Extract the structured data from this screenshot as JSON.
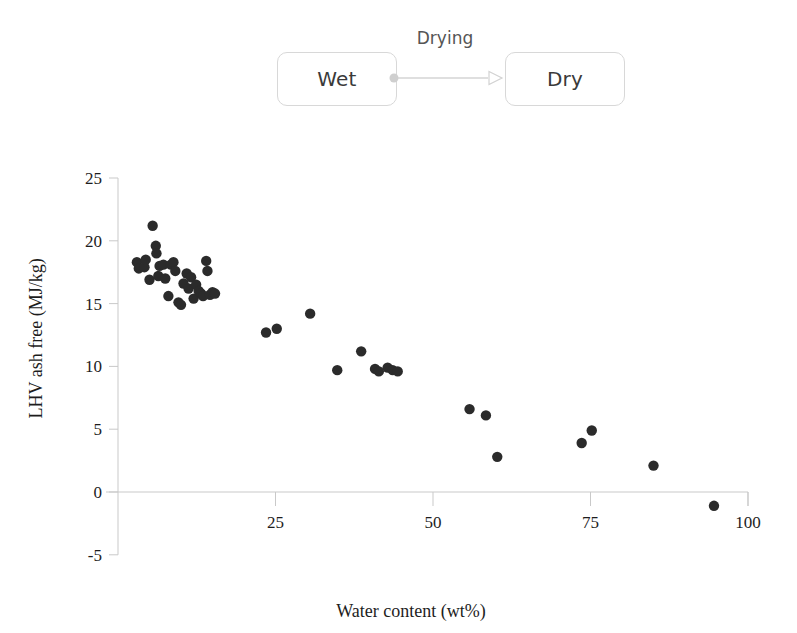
{
  "diagram": {
    "source_label": "Wet",
    "target_label": "Dry",
    "transition_label": "Drying",
    "arrow_icon": "arrow-right-icon",
    "source_dot_icon": "connector-dot-icon"
  },
  "chart_data": {
    "type": "scatter",
    "title": "",
    "xlabel": "Water content (wt%)",
    "ylabel": "LHV ash free (MJ/kg)",
    "xlim": [
      0,
      100
    ],
    "ylim": [
      -5,
      25
    ],
    "xticks": [
      25,
      50,
      75,
      100
    ],
    "yticks": [
      -5,
      0,
      5,
      10,
      15,
      20,
      25
    ],
    "xtick_labels": [
      "25",
      "50",
      "75",
      "100"
    ],
    "ytick_labels": [
      "-5",
      "0",
      "5",
      "10",
      "15",
      "20",
      "25"
    ],
    "grid": false,
    "legend": null,
    "marker_color": "#2b2b2b",
    "axis_color": "#c9c9c9",
    "zero_line": 0,
    "series": [
      {
        "name": "Fuel samples",
        "points": [
          [
            3.0,
            18.3
          ],
          [
            3.3,
            17.8
          ],
          [
            4.2,
            17.9
          ],
          [
            4.4,
            18.5
          ],
          [
            5.0,
            16.9
          ],
          [
            5.5,
            21.2
          ],
          [
            6.0,
            19.6
          ],
          [
            6.1,
            19.0
          ],
          [
            6.4,
            17.2
          ],
          [
            6.6,
            18.0
          ],
          [
            7.2,
            18.1
          ],
          [
            7.5,
            17.0
          ],
          [
            8.0,
            15.6
          ],
          [
            8.4,
            18.1
          ],
          [
            8.8,
            18.3
          ],
          [
            9.1,
            17.6
          ],
          [
            9.6,
            15.1
          ],
          [
            10.0,
            14.9
          ],
          [
            10.4,
            16.6
          ],
          [
            10.9,
            17.4
          ],
          [
            11.2,
            16.2
          ],
          [
            11.6,
            17.1
          ],
          [
            12.0,
            15.4
          ],
          [
            12.4,
            16.5
          ],
          [
            12.8,
            16.0
          ],
          [
            13.2,
            15.8
          ],
          [
            13.5,
            15.6
          ],
          [
            14.0,
            18.4
          ],
          [
            14.2,
            17.6
          ],
          [
            14.6,
            15.7
          ],
          [
            15.0,
            15.9
          ],
          [
            15.4,
            15.8
          ],
          [
            23.5,
            12.7
          ],
          [
            25.2,
            13.0
          ],
          [
            30.5,
            14.2
          ],
          [
            34.8,
            9.7
          ],
          [
            38.6,
            11.2
          ],
          [
            40.8,
            9.8
          ],
          [
            41.4,
            9.6
          ],
          [
            42.8,
            9.9
          ],
          [
            43.6,
            9.7
          ],
          [
            44.4,
            9.6
          ],
          [
            55.8,
            6.6
          ],
          [
            58.4,
            6.1
          ],
          [
            60.2,
            2.8
          ],
          [
            73.6,
            3.9
          ],
          [
            75.2,
            4.9
          ],
          [
            85.0,
            2.1
          ],
          [
            94.6,
            -1.1
          ]
        ]
      }
    ]
  }
}
